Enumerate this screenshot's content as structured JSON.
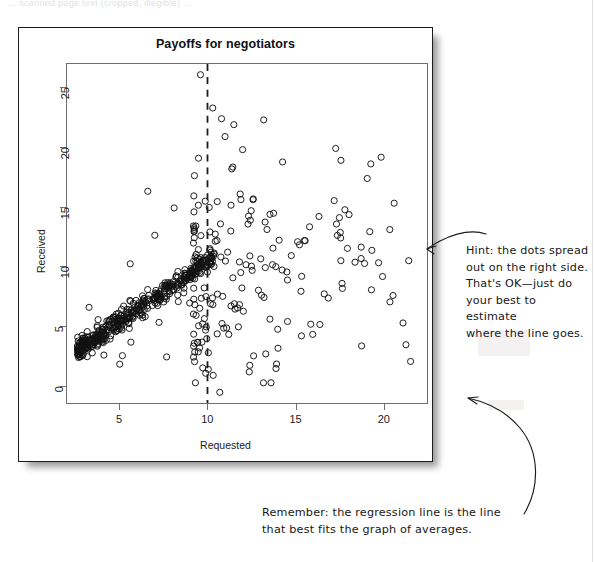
{
  "page": {
    "scan_top_text": "... scanned page text (cropped, illegible) ...",
    "background": "#ffffff"
  },
  "figure": {
    "title": "Payoffs for negotiators",
    "border_color": "#1b1b1b",
    "axis_color": "#6e6e6e"
  },
  "annotations": [
    {
      "name": "hint-note",
      "text": "Hint: the dots spread\nout on the right side.\nThat's OK—just do\nyour best to estimate\nwhere the line goes."
    },
    {
      "name": "remember-note",
      "text": "Remember: the regression line is the line\nthat best fits the graph of averages."
    }
  ],
  "chart_data": {
    "type": "scatter",
    "title": "Payoffs for negotiators",
    "xlabel": "Requested",
    "ylabel": "Received",
    "xlim": [
      2.0,
      22.5
    ],
    "ylim": [
      -1.5,
      27.0
    ],
    "xticks": [
      5,
      10,
      15,
      20
    ],
    "yticks": [
      0,
      5,
      10,
      15,
      20,
      25
    ],
    "xtick_labels": [
      "5",
      "10",
      "15",
      "20"
    ],
    "ytick_labels": [
      "0",
      "5",
      "10",
      "15",
      "20",
      "25"
    ],
    "grid": false,
    "legend": null,
    "marker": "open-circle",
    "marker_color": "#111111",
    "marker_size": 3.1,
    "n_points": 620,
    "annotation_lines": [
      {
        "name": "vertical-dashed-cutoff",
        "orientation": "vertical",
        "x": 10,
        "style": "dashed",
        "color": "#1b1b1b",
        "width": 1.8
      }
    ],
    "generator": {
      "seed": 20240517,
      "dense_band": {
        "n": 430,
        "x_range": [
          2.6,
          10.4
        ],
        "x_skew": 1.45,
        "slope": 1.02,
        "intercept": 0.25,
        "noise_sd": 0.42
      },
      "spread_cloud": {
        "n": 170,
        "x_range": [
          9.2,
          21.6
        ],
        "x_skew": 2.1,
        "y_mean_slope": 0.22,
        "y_mean_intercept": 8.6,
        "y_sd": 4.3,
        "y_clip": [
          0.2,
          23.0
        ]
      },
      "low_outliers": {
        "n": 20,
        "x_range": [
          3.0,
          14.0
        ],
        "y_range": [
          1.2,
          7.5
        ]
      }
    }
  }
}
